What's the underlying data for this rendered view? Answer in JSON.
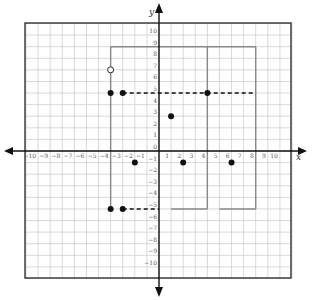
{
  "chart_data": {
    "type": "scatter",
    "title": "",
    "xlabel": "x",
    "ylabel": "y",
    "xlim": [
      -11,
      11
    ],
    "ylim": [
      -11,
      11
    ],
    "grid": true,
    "x_ticks": [
      -10,
      -9,
      -8,
      -7,
      -6,
      -5,
      -4,
      -3,
      -2,
      -1,
      1,
      2,
      3,
      4,
      5,
      6,
      7,
      8,
      9,
      10
    ],
    "y_ticks": [
      10,
      9,
      8,
      7,
      6,
      5,
      4,
      3,
      2,
      1,
      0,
      -1,
      -2,
      -3,
      -4,
      -5,
      -6,
      -7,
      -8,
      -9,
      -10
    ],
    "filled_points": [
      {
        "x": -4,
        "y": 5
      },
      {
        "x": -3,
        "y": 5
      },
      {
        "x": 4,
        "y": 5
      },
      {
        "x": 1,
        "y": 3
      },
      {
        "x": -2,
        "y": -1
      },
      {
        "x": 2,
        "y": -1
      },
      {
        "x": 6,
        "y": -1
      },
      {
        "x": -4,
        "y": -5
      },
      {
        "x": -3,
        "y": -5
      }
    ],
    "open_points": [
      {
        "x": -4,
        "y": 7
      }
    ],
    "solid_segments": [
      {
        "x1": -4,
        "y1": 9,
        "x2": 8,
        "y2": 9
      },
      {
        "x1": -4,
        "y1": 9,
        "x2": -4,
        "y2": -5
      },
      {
        "x1": 4,
        "y1": 9,
        "x2": 4,
        "y2": -5
      },
      {
        "x1": 8,
        "y1": 9,
        "x2": 8,
        "y2": -5
      },
      {
        "x1": 1,
        "y1": -5,
        "x2": 4,
        "y2": -5
      },
      {
        "x1": 5,
        "y1": -5,
        "x2": 8,
        "y2": -5
      }
    ],
    "dashed_segments": [
      {
        "x1": -3,
        "y1": 5,
        "x2": 8,
        "y2": 5
      },
      {
        "x1": -3,
        "y1": -5,
        "x2": 0,
        "y2": -5
      }
    ]
  },
  "axes": {
    "x_label": "x",
    "y_label": "y"
  },
  "colors": {
    "grid": "#c8c8c8",
    "border": "#333333",
    "axis": "#111111",
    "shape": "#888888",
    "point": "#111111"
  }
}
